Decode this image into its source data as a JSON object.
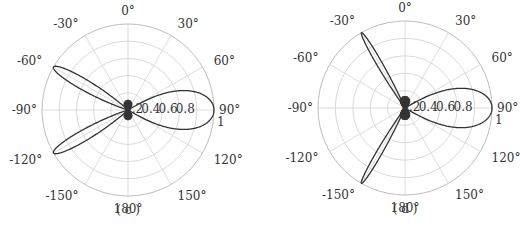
{
  "figure": {
    "panels": [
      {
        "id": "c",
        "caption": "( c )"
      },
      {
        "id": "d",
        "caption": "( d )"
      }
    ]
  },
  "chart_data": [
    {
      "type": "polar-line",
      "panel": "(c)",
      "title": "",
      "caption": "(c)",
      "theta_zero_location": "top",
      "theta_direction": "clockwise",
      "angle_ticks": [
        "0°",
        "30°",
        "60°",
        "90°",
        "120°",
        "150°",
        "180°",
        "-150°",
        "-120°",
        "-90°",
        "-60°",
        "-30°"
      ],
      "angle_tick_values": [
        0,
        30,
        60,
        90,
        120,
        150,
        180,
        -150,
        -120,
        -90,
        -60,
        -30
      ],
      "radial_ticks": [
        "0.2",
        "0.4",
        "0.6",
        "0.8",
        "1"
      ],
      "radial_tick_values": [
        0.2,
        0.4,
        0.6,
        0.8,
        1.0
      ],
      "rlim": [
        0,
        1
      ],
      "grid": true,
      "series": [
        {
          "name": "normalized pattern",
          "main_lobe": {
            "angle_deg": 90,
            "peak": 1.0,
            "half_width_deg": 30
          },
          "grating_lobes": [
            {
              "angle_deg": -60,
              "peak": 1.0,
              "half_width_deg": 14
            },
            {
              "angle_deg": -120,
              "peak": 1.0,
              "half_width_deg": 14
            }
          ],
          "side_lobe_level": 0.12,
          "side_lobe_count": 40
        }
      ]
    },
    {
      "type": "polar-line",
      "panel": "(d)",
      "title": "",
      "caption": "(d)",
      "theta_zero_location": "top",
      "theta_direction": "clockwise",
      "angle_ticks": [
        "0°",
        "30°",
        "60°",
        "90°",
        "120°",
        "150°",
        "180°",
        "-150°",
        "-120°",
        "-90°",
        "-60°",
        "-30°"
      ],
      "angle_tick_values": [
        0,
        30,
        60,
        90,
        120,
        150,
        180,
        -150,
        -120,
        -90,
        -60,
        -30
      ],
      "radial_ticks": [
        "0.2",
        "0.4",
        "0.6",
        "0.8",
        "1"
      ],
      "radial_tick_values": [
        0.2,
        0.4,
        0.6,
        0.8,
        1.0
      ],
      "rlim": [
        0,
        1
      ],
      "grid": true,
      "series": [
        {
          "name": "normalized pattern",
          "main_lobe": {
            "angle_deg": 90,
            "peak": 1.0,
            "half_width_deg": 30
          },
          "grating_lobes": [
            {
              "angle_deg": -30,
              "peak": 1.0,
              "half_width_deg": 7
            },
            {
              "angle_deg": -150,
              "peak": 1.0,
              "half_width_deg": 7
            }
          ],
          "side_lobe_level": 0.14,
          "side_lobe_count": 50
        }
      ]
    }
  ]
}
